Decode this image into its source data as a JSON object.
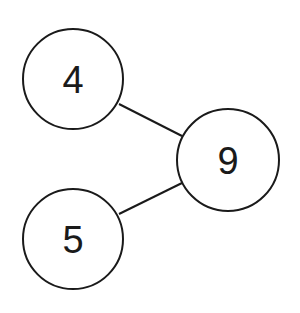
{
  "diagram": {
    "type": "number-bond",
    "whole": {
      "label": "9",
      "cx": 228,
      "cy": 160,
      "r": 51
    },
    "parts": [
      {
        "label": "4",
        "cx": 73,
        "cy": 79,
        "r": 50
      },
      {
        "label": "5",
        "cx": 73,
        "cy": 239,
        "r": 50
      }
    ],
    "stroke_color": "#1a1a1a",
    "background": "#ffffff"
  }
}
